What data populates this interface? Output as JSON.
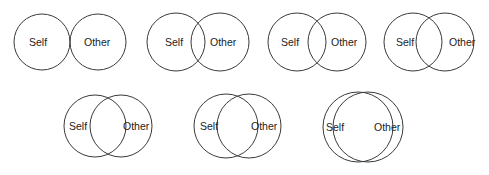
{
  "figure": {
    "labels": {
      "self": "Self",
      "other": "Other"
    },
    "stroke_color": "#3a3a3a",
    "text_color": "#222222",
    "background": "#ffffff"
  },
  "diagrams": [
    {
      "index": 1,
      "self_label": "Self",
      "other_label": "Other",
      "self": {
        "cx": 42,
        "cy": 42,
        "r": 28
      },
      "other": {
        "cx": 98,
        "cy": 42,
        "r": 28
      },
      "self_text": {
        "x": 29,
        "y": 46
      },
      "other_text": {
        "x": 84,
        "y": 46
      }
    },
    {
      "index": 2,
      "self_label": "Self",
      "other_label": "Other",
      "self": {
        "cx": 176,
        "cy": 42,
        "r": 29
      },
      "other": {
        "cx": 220,
        "cy": 42,
        "r": 29
      },
      "self_text": {
        "x": 165,
        "y": 46
      },
      "other_text": {
        "x": 210,
        "y": 46
      }
    },
    {
      "index": 3,
      "self_label": "Self",
      "other_label": "Other",
      "self": {
        "cx": 297,
        "cy": 42,
        "r": 29
      },
      "other": {
        "cx": 337,
        "cy": 42,
        "r": 29
      },
      "self_text": {
        "x": 281,
        "y": 46
      },
      "other_text": {
        "x": 331,
        "y": 46
      }
    },
    {
      "index": 4,
      "self_label": "Self",
      "other_label": "Other",
      "self": {
        "cx": 413,
        "cy": 42,
        "r": 29
      },
      "other": {
        "cx": 445,
        "cy": 42,
        "r": 29
      },
      "self_text": {
        "x": 396,
        "y": 46
      },
      "other_text": {
        "x": 449,
        "y": 46
      }
    },
    {
      "index": 5,
      "self_label": "Self",
      "other_label": "Other",
      "self": {
        "cx": 95,
        "cy": 126,
        "r": 31
      },
      "other": {
        "cx": 121,
        "cy": 126,
        "r": 31
      },
      "self_text": {
        "x": 69,
        "y": 130
      },
      "other_text": {
        "x": 123,
        "y": 130
      }
    },
    {
      "index": 6,
      "self_label": "Self",
      "other_label": "Other",
      "self": {
        "cx": 226,
        "cy": 126,
        "r": 32
      },
      "other": {
        "cx": 249,
        "cy": 126,
        "r": 32
      },
      "self_text": {
        "x": 200,
        "y": 130
      },
      "other_text": {
        "x": 251,
        "y": 130
      }
    },
    {
      "index": 7,
      "self_label": "Self",
      "other_label": "Other",
      "self": {
        "cx": 358,
        "cy": 127,
        "r": 35
      },
      "other": {
        "cx": 368,
        "cy": 127,
        "r": 35
      },
      "self_text": {
        "x": 326,
        "y": 131
      },
      "other_text": {
        "x": 374,
        "y": 131
      }
    }
  ]
}
